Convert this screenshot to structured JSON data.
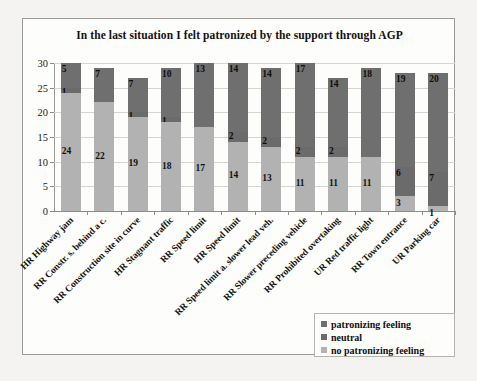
{
  "chart_data": {
    "type": "bar",
    "stacked": true,
    "title": "In the last situation I felt patronized by the support through AGP",
    "xlabel": "",
    "ylabel": "",
    "ylim": [
      0,
      30
    ],
    "yticks": [
      0,
      5,
      10,
      15,
      20,
      25,
      30
    ],
    "grid": true,
    "legend_position": "bottom-right",
    "categories": [
      "HR Highway jam",
      "RR Constr. s. behind a c.",
      "RR Construction site in curve",
      "HR Stagnant traffic",
      "RR Speed limit",
      "HR Speed limit",
      "RR Speed limit a. slower lead veh.",
      "RR Slower preceding vehicle",
      "RR Prohibited overtaking",
      "UR Red traffic light",
      "RR Town entrance",
      "UR Parking car"
    ],
    "series": [
      {
        "name": "patronizing feeling",
        "color": "#6f6f6f",
        "values": [
          5,
          7,
          7,
          10,
          13,
          14,
          14,
          17,
          14,
          18,
          19,
          20
        ]
      },
      {
        "name": "neutral",
        "color": "#6b6b6b",
        "values": [
          1,
          0,
          1,
          1,
          0,
          2,
          2,
          2,
          2,
          0,
          6,
          7
        ]
      },
      {
        "name": "no patronizing feeling",
        "color": "#b2b2b2",
        "values": [
          24,
          22,
          19,
          18,
          17,
          14,
          13,
          11,
          11,
          11,
          3,
          1
        ]
      }
    ],
    "totals": [
      30,
      29,
      27,
      29,
      30,
      30,
      29,
      30,
      27,
      29,
      28,
      28
    ]
  },
  "legend": {
    "items": [
      {
        "label": "patronizing feeling",
        "color": "#6f6f6f"
      },
      {
        "label": "neutral",
        "color": "#6b6b6b"
      },
      {
        "label": "no patronizing feeling",
        "color": "#b2b2b2"
      }
    ]
  }
}
